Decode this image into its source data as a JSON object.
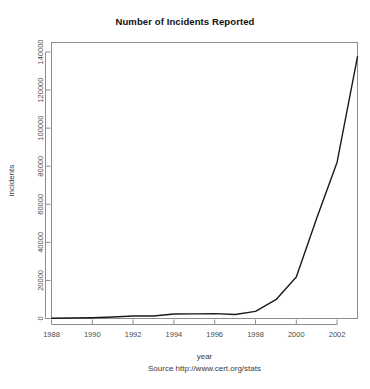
{
  "chart_data": {
    "type": "line",
    "title": "Number of Incidents Reported",
    "xlabel": "year",
    "ylabel": "incidents",
    "caption": "Source http://www.cert.org/stats",
    "grid": false,
    "legend": "none",
    "xlim": [
      1988,
      2003
    ],
    "ylim": [
      0,
      145000
    ],
    "xticks": [
      1988,
      1990,
      1992,
      1994,
      1996,
      1998,
      2000,
      2002
    ],
    "xtick_labels": [
      "1988",
      "1990",
      "1992",
      "1994",
      "1996",
      "1998",
      "2000",
      "2002"
    ],
    "yticks": [
      0,
      20000,
      40000,
      60000,
      80000,
      100000,
      120000,
      140000
    ],
    "ytick_labels": [
      "0",
      "20000",
      "40000",
      "60000",
      "80000",
      "100000",
      "120000",
      "140000"
    ],
    "x": [
      1988,
      1989,
      1990,
      1991,
      1992,
      1993,
      1994,
      1995,
      1996,
      1997,
      1998,
      1999,
      2000,
      2001,
      2002,
      2003
    ],
    "values": [
      132,
      252,
      406,
      773,
      1334,
      1334,
      2340,
      2412,
      2573,
      2134,
      3734,
      9859,
      21756,
      52658,
      82094,
      137529
    ],
    "series": [
      {
        "name": "incidents",
        "values": [
          132,
          252,
          406,
          773,
          1334,
          1334,
          2340,
          2412,
          2573,
          2134,
          3734,
          9859,
          21756,
          52658,
          82094,
          137529
        ]
      }
    ],
    "line_color": "#1a1a1a",
    "frame_color": "#8d8d8d",
    "background": "#ffffff"
  }
}
